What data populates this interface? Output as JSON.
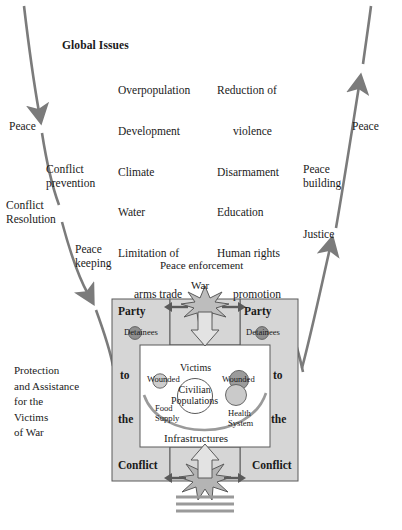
{
  "diagram": {
    "title_node": "Global Issues",
    "cycle": {
      "peace_left": "Peace",
      "peace_right": "Peace",
      "conflict_prevention": "Conflict\nprevention",
      "conflict_resolution": "Conflict\nResolution",
      "peace_keeping": "Peace\nkeeping",
      "peace_building": "Peace\nbuilding",
      "justice": "Justice",
      "peace_enforcement": "Peace enforcement"
    },
    "global_issues": {
      "heading": "Global Issues",
      "column_left": [
        {
          "text": "Overpopulation",
          "indent": false
        },
        {
          "text": "Development",
          "indent": false
        },
        {
          "text": "Climate",
          "indent": false
        },
        {
          "text": "Water",
          "indent": false
        },
        {
          "text": "Limitation of",
          "indent": false
        },
        {
          "text": "arms trade",
          "indent": true
        }
      ],
      "column_right": [
        {
          "text": "Reduction of",
          "indent": false
        },
        {
          "text": "violence",
          "indent": true
        },
        {
          "text": "Disarmament",
          "indent": false
        },
        {
          "text": "Education",
          "indent": false
        },
        {
          "text": "Human rights",
          "indent": false
        },
        {
          "text": "promotion",
          "indent": true
        }
      ]
    },
    "war_structure": {
      "war_label": "War",
      "party_left": "Party",
      "party_right": "Party",
      "detainees_left": "Detainees",
      "detainees_right": "Detainees",
      "to_left": "to",
      "to_right": "to",
      "the_left": "the",
      "the_right": "the",
      "conflict_left": "Conflict",
      "conflict_right": "Conflict",
      "victims": "Victims",
      "wounded_left": "Wounded",
      "wounded_right": "Wounded",
      "civilian_populations": "Civilian\nPopulations",
      "food_supply": "Food\nSupply",
      "health_system": "Health\nSystem",
      "infrastructures": "Infrastructures"
    },
    "side_caption": "Protection\nand Assistance\nfor the\nVictims\nof War",
    "colors": {
      "arrow_gray": "#7b7b7b",
      "panel_gray": "#d6d6d6",
      "star_gray": "#b9b9b9",
      "dot_dark_gray": "#8e8e8e",
      "dot_light_gray": "#c8c8c8",
      "outline": "#4a4a4a",
      "text": "#1a1a1a"
    }
  }
}
